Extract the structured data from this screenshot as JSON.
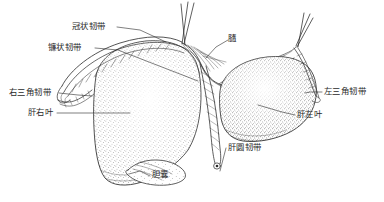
{
  "figure": {
    "kind": "anatomical-illustration",
    "background_color": "#ffffff",
    "ink_color": "#2a2a2a",
    "labels": [
      {
        "id": "coronary-ligament",
        "text": "冠状韧带"
      },
      {
        "id": "falciform-ligament",
        "text": "镰状韧带"
      },
      {
        "id": "right-triangular-ligament",
        "text": "右三角韧带"
      },
      {
        "id": "right-lobe-of-liver",
        "text": "肝右叶"
      },
      {
        "id": "diaphragm",
        "text": "膸"
      },
      {
        "id": "left-triangular-ligament",
        "text": "左三角韧带"
      },
      {
        "id": "left-lobe-of-liver",
        "text": "肝左叶"
      },
      {
        "id": "round-ligament-of-liver",
        "text": "肝圆韧带"
      },
      {
        "id": "gallbladder",
        "text": "胆囊"
      }
    ]
  }
}
